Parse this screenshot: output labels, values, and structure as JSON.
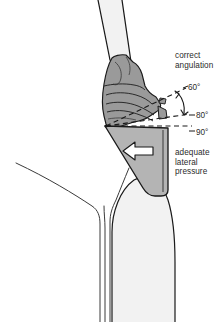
{
  "figure": {
    "width": 224,
    "height": 322,
    "background_color": "#ffffff"
  },
  "annotations": {
    "correct_angulation": {
      "line1": "correct",
      "line2": "angulation"
    },
    "lateral_pressure": {
      "line1": "adequate",
      "line2": "lateral",
      "line3": "pressure"
    }
  },
  "angle_markers": [
    {
      "id": "angle-60",
      "label": "60°",
      "value": 60,
      "style": "dashed-ray"
    },
    {
      "id": "angle-80",
      "label": "80°",
      "value": 80,
      "style": "dashed-ray"
    },
    {
      "id": "angle-90",
      "label": "90°",
      "value": 90,
      "style": "dashed-horizontal"
    }
  ],
  "arrow": {
    "name": "lateral-pressure-arrow",
    "direction": "left",
    "fill": "#ffffff",
    "stroke": "#1a1a1a"
  },
  "anatomy": [
    {
      "name": "tooth-root-upper",
      "fill": "#f2f2f2",
      "stroke": "#1a1a1a"
    },
    {
      "name": "tooth-crown-lower",
      "fill": "#f2f2f2",
      "stroke": "#1a1a1a"
    },
    {
      "name": "gingiva-outline",
      "fill": "#ffffff",
      "stroke": "#3a3a3a"
    },
    {
      "name": "calculus-deposit",
      "fill": "#9a9a9a",
      "stroke": "#1a1a1a"
    },
    {
      "name": "instrument-blade",
      "fill": "#b4b4b4",
      "stroke": "#1a1a1a"
    }
  ],
  "colors": {
    "calculus_gray": "#9a9a9a",
    "instrument_gray": "#b4b4b4",
    "tooth_light": "#f2f2f2",
    "outline": "#1a1a1a",
    "text": "#2b2b2b"
  }
}
